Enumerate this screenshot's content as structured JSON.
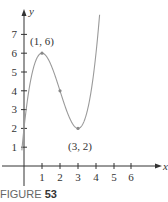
{
  "chart_data": {
    "type": "line",
    "title": "",
    "xlabel": "x",
    "ylabel": "y",
    "function": "y = x^3 - 6x^2 + 9x + 2",
    "x_ticks": [
      1,
      2,
      3,
      4,
      5,
      6
    ],
    "y_ticks": [
      1,
      2,
      3,
      4,
      5,
      6,
      7
    ],
    "xlim": [
      -0.4,
      7.4
    ],
    "ylim": [
      -1,
      8.3
    ],
    "grid": false,
    "series": [
      {
        "name": "f(x)",
        "x": [
          -0.1,
          0,
          0.5,
          1,
          1.5,
          2,
          2.5,
          3,
          3.5,
          4,
          4.2
        ],
        "values": [
          1.04,
          2,
          5.13,
          6,
          5.38,
          4,
          2.63,
          2,
          2.88,
          6,
          8.05
        ]
      }
    ],
    "marked_points": [
      {
        "x": 1,
        "y": 6,
        "label": "(1, 6)"
      },
      {
        "x": 2,
        "y": 4,
        "label": ""
      },
      {
        "x": 3,
        "y": 2,
        "label": "(3, 2)"
      }
    ],
    "annotations": [
      "(1, 6)",
      "(3, 2)"
    ],
    "line_color": "#9a9a9a",
    "axis_color": "#333333"
  },
  "labels": {
    "x_axis": "x",
    "y_axis": "y",
    "x_ticks": [
      "1",
      "2",
      "3",
      "4",
      "5",
      "6"
    ],
    "y_ticks": [
      "1",
      "2",
      "3",
      "4",
      "5",
      "6",
      "7"
    ],
    "max_point": "(1, 6)",
    "min_point": "(3, 2)"
  },
  "caption": {
    "prefix": "FIGURE ",
    "number": "53"
  }
}
